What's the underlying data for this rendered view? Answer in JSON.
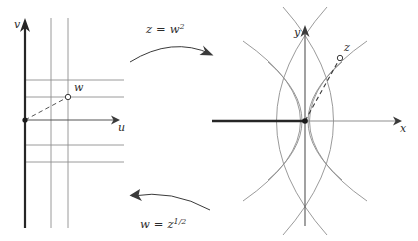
{
  "figure": {
    "background_color": "#ffffff",
    "grid_color": "#8f8f8f",
    "axis_color": "#3a3a3a",
    "heavy_color": "#262626",
    "dash_color": "#555555",
    "text_color": "#2b2b2b"
  },
  "left_panel": {
    "name": "w-plane",
    "axes": {
      "vertical_label": "v",
      "horizontal_label": "u"
    },
    "points": [
      {
        "id": "origin-dot",
        "label": "",
        "style": "filled",
        "x": 25,
        "y": 120
      },
      {
        "id": "w-point",
        "label": "w",
        "style": "open",
        "x": 68,
        "y": 97
      }
    ],
    "grid": {
      "vertical_lines_x": [
        51,
        68
      ],
      "horizontal_lines_y": [
        80,
        97,
        145,
        162
      ]
    },
    "dashed_segment": {
      "from": [
        25,
        120
      ],
      "to": [
        68,
        97
      ]
    }
  },
  "right_panel": {
    "name": "z-plane",
    "axes": {
      "vertical_label": "y",
      "horizontal_label": "x"
    },
    "points": [
      {
        "id": "origin-dot",
        "label": "",
        "style": "filled",
        "x": 305,
        "y": 121
      },
      {
        "id": "z-point",
        "label": "z",
        "style": "open",
        "x": 340,
        "y": 58
      }
    ],
    "branch_cut": {
      "from": [
        212,
        121
      ],
      "to": [
        305,
        121
      ]
    },
    "dashed_segment": {
      "from": [
        305,
        121
      ],
      "to": [
        340,
        58
      ]
    },
    "curve_family": "confocal parabolas"
  },
  "arrows": {
    "forward": {
      "label_lhs": "z",
      "label_op": "=",
      "label_rhs": "w",
      "label_exp": "2",
      "direction": "left-to-right",
      "position": "top"
    },
    "backward": {
      "label_lhs": "w",
      "label_op": "=",
      "label_rhs": "z",
      "label_exp": "1/2",
      "direction": "right-to-left",
      "position": "bottom"
    }
  }
}
